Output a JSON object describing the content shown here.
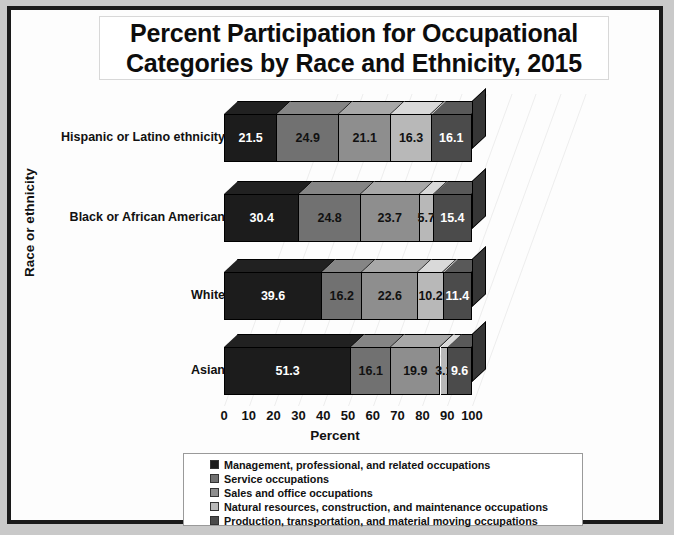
{
  "chart_data": {
    "type": "bar",
    "orientation": "horizontal",
    "stacked": true,
    "style": "3d-stacked-horizontal-bar",
    "title": "Percent Participation for Occupational Categories by Race and Ethnicity, 2015",
    "title_lines": [
      "Percent Participation for Occupational",
      "Categories by Race and Ethnicity, 2015"
    ],
    "xlabel": "Percent",
    "ylabel": "Race or ethnicity",
    "xlim": [
      0,
      100
    ],
    "xticks": [
      0,
      10,
      20,
      30,
      40,
      50,
      60,
      70,
      80,
      90,
      100
    ],
    "grid": true,
    "legend_position": "bottom",
    "categories": [
      "Hispanic or Latino ethnicity",
      "Black or African American",
      "White",
      "Asian"
    ],
    "series": [
      {
        "name": "Management, professional, and related occupations",
        "color": "#1c1c1c",
        "label_color": "#ffffff",
        "values": [
          21.5,
          30.4,
          39.6,
          51.3
        ]
      },
      {
        "name": "Service occupations",
        "color": "#717171",
        "label_color": "#111111",
        "values": [
          24.9,
          24.8,
          16.2,
          16.1
        ]
      },
      {
        "name": "Sales and office occupations",
        "color": "#8e8e8e",
        "label_color": "#111111",
        "values": [
          21.1,
          23.7,
          22.6,
          19.9
        ]
      },
      {
        "name": "Natural resources, construction, and maintenance occupations",
        "color": "#b8b8b8",
        "label_color": "#111111",
        "values": [
          16.3,
          5.7,
          10.2,
          3.1
        ]
      },
      {
        "name": "Production, transportation, and material moving occupations",
        "color": "#4b4b4b",
        "label_color": "#ffffff",
        "values": [
          16.1,
          15.4,
          11.4,
          9.6
        ]
      }
    ]
  },
  "legend": {
    "items": [
      "Management, professional, and related occupations",
      "Service occupations",
      "Sales and office occupations",
      "Natural resources, construction, and maintenance occupations",
      "Production, transportation, and material moving occupations"
    ]
  },
  "colors": {
    "frame": "#1a1a1a",
    "background": "#c9c9c9",
    "canvas": "#fdfdfd",
    "gridline": "#ececec"
  }
}
